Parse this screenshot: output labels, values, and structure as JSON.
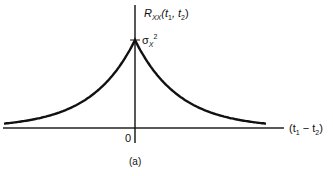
{
  "figure": {
    "y_axis_label": {
      "main": "R",
      "sub": "XX",
      "args": "(t",
      "a1": "1",
      "sep": ", t",
      "a2": "2",
      "close": ")"
    },
    "peak_label": {
      "main": "σ",
      "sub": "X",
      "sup": "2"
    },
    "x_axis_label": {
      "open": "(t",
      "a1": "1",
      "sep": " − t",
      "a2": "2",
      "close": ")"
    },
    "origin_label": "0",
    "caption": "(a)",
    "curve": "exponential decay R(τ) = σ_X² e^{-a|τ|}, symmetric about 0"
  }
}
